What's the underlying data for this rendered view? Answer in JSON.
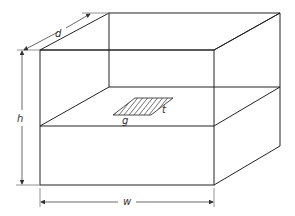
{
  "diagram": {
    "labels": {
      "depth": "d",
      "height": "h",
      "width": "w",
      "area_length": "g",
      "area_thickness": "t"
    },
    "colors": {
      "line": "#222222",
      "dimension": "#444444",
      "background": "#ffffff"
    }
  }
}
